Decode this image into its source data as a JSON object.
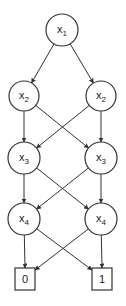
{
  "diagram": {
    "type": "binary decision diagram",
    "stroke_color": "#333333",
    "background": "#ffffff",
    "nodes": [
      {
        "id": "n1",
        "var": "x",
        "sub": "1",
        "shape": "circle",
        "cx": 62,
        "cy": 30,
        "r": 16
      },
      {
        "id": "n2L",
        "var": "x",
        "sub": "2",
        "shape": "circle",
        "cx": 24,
        "cy": 96,
        "r": 15
      },
      {
        "id": "n2R",
        "var": "x",
        "sub": "2",
        "shape": "circle",
        "cx": 101,
        "cy": 96,
        "r": 15
      },
      {
        "id": "n3L",
        "var": "x",
        "sub": "3",
        "shape": "circle",
        "cx": 24,
        "cy": 158,
        "r": 16
      },
      {
        "id": "n3R",
        "var": "x",
        "sub": "3",
        "shape": "circle",
        "cx": 101,
        "cy": 158,
        "r": 16
      },
      {
        "id": "n4L",
        "var": "x",
        "sub": "4",
        "shape": "circle",
        "cx": 24,
        "cy": 219,
        "r": 16
      },
      {
        "id": "n4R",
        "var": "x",
        "sub": "4",
        "shape": "circle",
        "cx": 101,
        "cy": 219,
        "r": 16
      }
    ],
    "terminals": [
      {
        "id": "t0",
        "label": "0",
        "x": 15,
        "y": 268,
        "w": 20,
        "h": 22
      },
      {
        "id": "t1",
        "label": "1",
        "x": 92,
        "y": 268,
        "w": 20,
        "h": 22
      }
    ],
    "edges": [
      {
        "from": "n1",
        "to": "n2L"
      },
      {
        "from": "n1",
        "to": "n2R"
      },
      {
        "from": "n2L",
        "to": "n3L"
      },
      {
        "from": "n2L",
        "to": "n3R"
      },
      {
        "from": "n2R",
        "to": "n3L"
      },
      {
        "from": "n2R",
        "to": "n3R"
      },
      {
        "from": "n3L",
        "to": "n4L"
      },
      {
        "from": "n3L",
        "to": "n4R"
      },
      {
        "from": "n3R",
        "to": "n4L"
      },
      {
        "from": "n3R",
        "to": "n4R"
      },
      {
        "from": "n4L",
        "to": "t0"
      },
      {
        "from": "n4L",
        "to": "t1"
      },
      {
        "from": "n4R",
        "to": "t0"
      },
      {
        "from": "n4R",
        "to": "t1"
      }
    ]
  }
}
